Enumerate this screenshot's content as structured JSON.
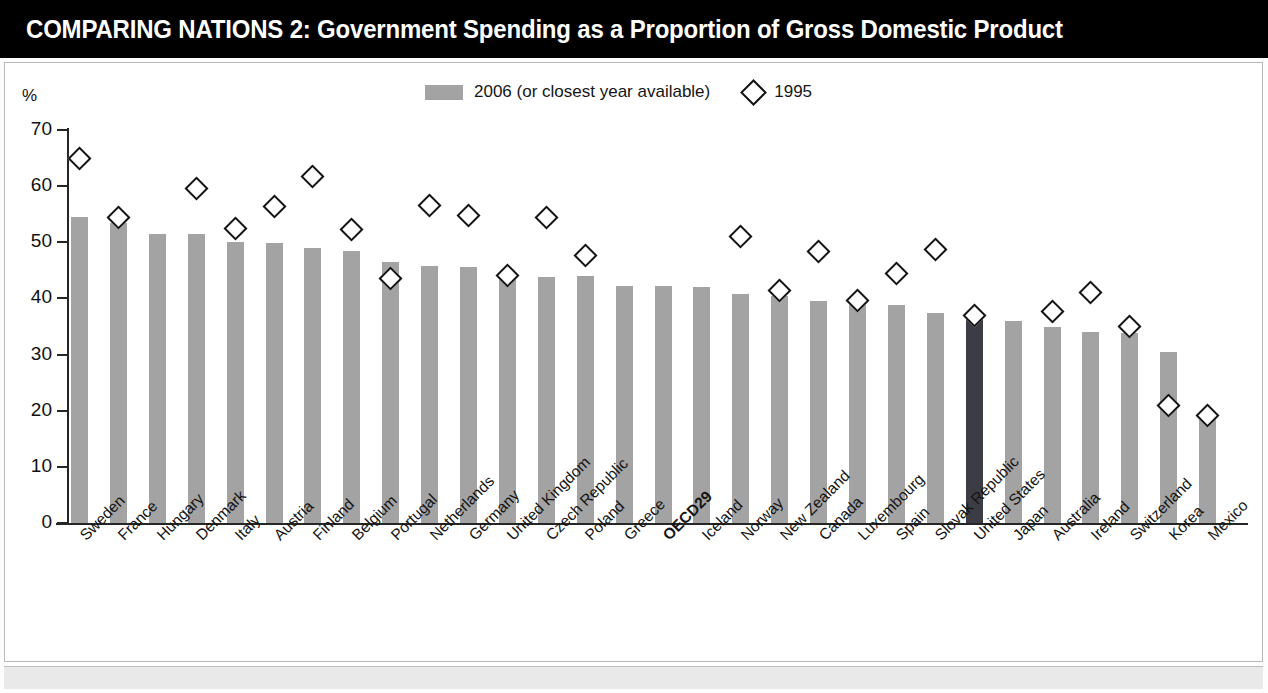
{
  "header": {
    "title": "COMPARING NATIONS 2: Government Spending as a Proportion of Gross Domestic Product"
  },
  "legend": {
    "bar_label": "2006 (or closest year available)",
    "marker_label": "1995",
    "bar_color": "#a3a3a3",
    "marker_color": "#141414"
  },
  "axis": {
    "unit_label": "%",
    "y_ticks": [
      "0",
      "10",
      "20",
      "30",
      "40",
      "50",
      "60",
      "70"
    ]
  },
  "colors": {
    "bar": "#a3a3a3",
    "highlight_bar": "#3c3c44",
    "title_bg": "#000000",
    "title_fg": "#ffffff",
    "axis": "#262626"
  },
  "chart_data": {
    "type": "bar",
    "title": "COMPARING NATIONS 2: Government Spending as a Proportion of Gross Domestic Product",
    "xlabel": "",
    "ylabel": "%",
    "ylim": [
      0,
      70
    ],
    "ytick_step": 10,
    "grid": false,
    "legend_position": "top-center",
    "highlight_category": "United States",
    "categories": [
      "Sweden",
      "France",
      "Hungary",
      "Denmark",
      "Italy",
      "Austria",
      "Finland",
      "Belgium",
      "Portugal",
      "Netherlands",
      "Germany",
      "United Kingdom",
      "Czech Republic",
      "Poland",
      "Greece",
      "OECD29",
      "Iceland",
      "Norway",
      "New Zealand",
      "Canada",
      "Luxembourg",
      "Spain",
      "Slovak Republic",
      "United States",
      "Japan",
      "Australia",
      "Ireland",
      "Switzerland",
      "Korea",
      "Mexico"
    ],
    "bold_categories": [
      "OECD29"
    ],
    "series": [
      {
        "name": "2006 (or closest year available)",
        "type": "bar",
        "values": [
          54.5,
          53.4,
          51.5,
          51.4,
          50.1,
          49.8,
          48.9,
          48.5,
          46.4,
          45.8,
          45.6,
          44.0,
          43.9,
          44.0,
          42.3,
          42.2,
          42.0,
          40.7,
          40.5,
          39.5,
          38.9,
          38.8,
          37.4,
          36.8,
          36.0,
          34.9,
          34.1,
          33.8,
          30.4,
          18.8
        ]
      },
      {
        "name": "1995",
        "type": "marker-diamond",
        "values": [
          65.0,
          54.4,
          null,
          59.5,
          52.5,
          56.4,
          61.7,
          52.2,
          43.6,
          56.6,
          54.7,
          44.0,
          54.5,
          47.7,
          null,
          null,
          null,
          51.1,
          41.5,
          48.4,
          39.7,
          44.4,
          48.8,
          37.0,
          null,
          37.7,
          41.1,
          35.0,
          21.0,
          19.2
        ]
      }
    ]
  }
}
